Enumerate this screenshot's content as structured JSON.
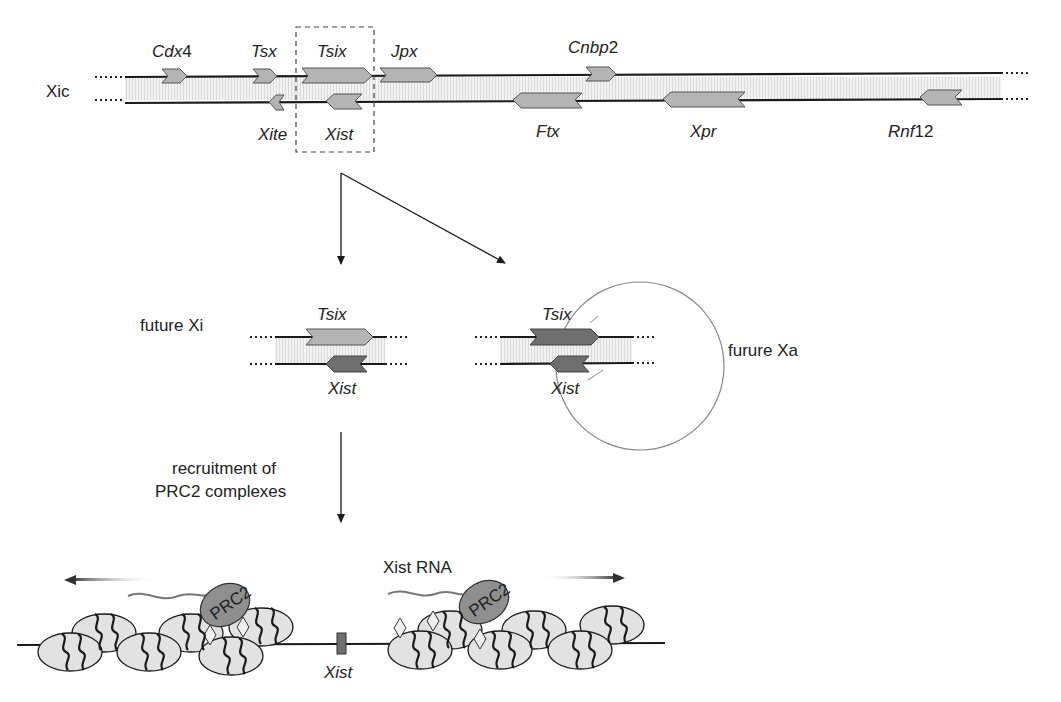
{
  "locus": {
    "name": "Xic",
    "top_genes": [
      {
        "label": "Cdx4",
        "italic_part": "Cdx",
        "suffix": "4"
      },
      {
        "label": "Tsx"
      },
      {
        "label": "Tsix"
      },
      {
        "label": "Jpx"
      },
      {
        "label": "Cnbp2",
        "italic_part": "Cnbp",
        "suffix": "2"
      }
    ],
    "bottom_genes": [
      {
        "label": "Xite"
      },
      {
        "label": "Xist"
      },
      {
        "label": "Ftx"
      },
      {
        "label": "Xpr"
      },
      {
        "label": "Rnf12",
        "italic_part": "Rnf",
        "suffix": "12"
      }
    ]
  },
  "branches": {
    "left": {
      "label": "future Xi",
      "top_gene": "Tsix",
      "bottom_gene": "Xist"
    },
    "right": {
      "label": "furure Xa",
      "top_gene": "Tsix",
      "bottom_gene": "Xist"
    }
  },
  "step": {
    "line1": "recruitment of",
    "line2": "PRC2 complexes"
  },
  "chromatin": {
    "rna_label": "Xist RNA",
    "locus_label": "Xist",
    "complex_label": "PRC2"
  },
  "colors": {
    "gene_light": "#b4b4b4",
    "gene_dark": "#6e6e6e",
    "band": "#ececec",
    "nucleosome": "#e2e2e2",
    "prc2": "#8f8f8f",
    "line": "#1a1a1a"
  }
}
